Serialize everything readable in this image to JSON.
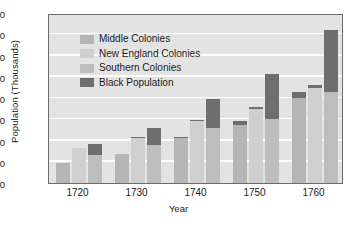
{
  "chart_data": {
    "type": "bar",
    "title": "",
    "xlabel": "Year",
    "ylabel": "Population (Thousands)",
    "ylim": [
      0,
      800
    ],
    "ytick_values": [
      0,
      100,
      200,
      300,
      400,
      500,
      600,
      700,
      800
    ],
    "ytick_labels": [
      "0",
      "100",
      "200",
      "300",
      "400",
      "500",
      "600",
      "700",
      "800"
    ],
    "categories": [
      "1720",
      "1730",
      "1740",
      "1750",
      "1760"
    ],
    "grid": "horizontal",
    "legend_position": "upper-left-inside",
    "stacked": "Black Population stacked on top of each colony bar",
    "series": [
      {
        "name": "Middle Colonies",
        "color": "#b5b5b5",
        "values": [
          95,
          135,
          212,
          275,
          400
        ]
      },
      {
        "name": "New England Colonies",
        "color": "#cfcfcf",
        "values": [
          165,
          210,
          290,
          348,
          445
        ]
      },
      {
        "name": "Southern Colonies",
        "color": "#bdbdbd",
        "values": [
          130,
          180,
          258,
          303,
          428
        ]
      },
      {
        "name": "Black Population",
        "color": "#6e6e6e",
        "values_on_middle": [
          0,
          0,
          5,
          18,
          30
        ],
        "values_on_newengland": [
          0,
          5,
          8,
          12,
          15
        ],
        "values_on_southern": [
          55,
          80,
          138,
          208,
          292
        ]
      }
    ],
    "bar_tops": {
      "1720": {
        "middle": 95,
        "newengland": 165,
        "southern_total": 185
      },
      "1730": {
        "middle": 135,
        "newengland": 212,
        "southern_total": 260
      },
      "1740": {
        "middle": 212,
        "newengland": 296,
        "southern_total": 396
      },
      "1750": {
        "middle": 293,
        "newengland": 360,
        "southern_total": 511
      },
      "1760": {
        "middle": 430,
        "newengland": 458,
        "southern_total": 720
      }
    }
  },
  "legend": {
    "items": [
      {
        "label": "Middle Colonies",
        "color": "#b5b5b5"
      },
      {
        "label": "New England Colonies",
        "color": "#cfcfcf"
      },
      {
        "label": "Southern Colonies",
        "color": "#bdbdbd"
      },
      {
        "label": "Black Population",
        "color": "#6e6e6e"
      }
    ]
  }
}
